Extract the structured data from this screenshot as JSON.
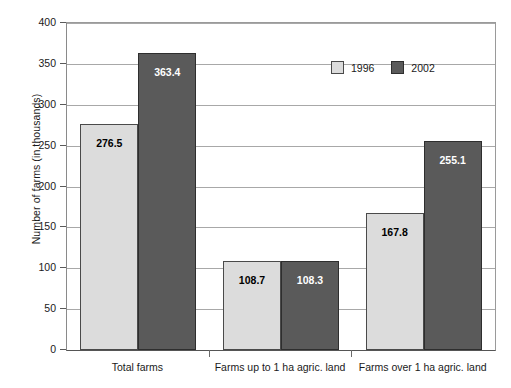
{
  "chart_data": {
    "type": "bar",
    "title": "",
    "subtitle": "",
    "xlabel": "",
    "ylabel": "Number of farms (in thousands)",
    "categories": [
      "Total farms",
      "Farms up to 1 ha agric. land",
      "Farms over 1 ha agric. land"
    ],
    "series": [
      {
        "name": "1996",
        "color": "#dcdcdc",
        "values": [
          276.5,
          108.7,
          167.8
        ],
        "labels": [
          "276.5",
          "108.7",
          "167.8"
        ]
      },
      {
        "name": "2002",
        "color": "#5a5a5a",
        "values": [
          363.4,
          108.3,
          255.1
        ],
        "labels": [
          "363.4",
          "108.3",
          "255.1"
        ]
      }
    ],
    "ylim": [
      0,
      400
    ],
    "yticks": [
      0,
      50,
      100,
      150,
      200,
      250,
      300,
      350,
      400
    ],
    "ytick_labels": [
      "0",
      "50",
      "100",
      "150",
      "200",
      "250",
      "300",
      "350",
      "400"
    ],
    "grid": true,
    "grid_axis": "y",
    "legend_position": "upper-right-inside",
    "bar_group_gap": true,
    "plot_background": "#ffffff",
    "axis_color": "#555555",
    "grid_color": "#a8a8a8"
  },
  "legend": {
    "entries": [
      {
        "label": "1996"
      },
      {
        "label": "2002"
      }
    ]
  }
}
